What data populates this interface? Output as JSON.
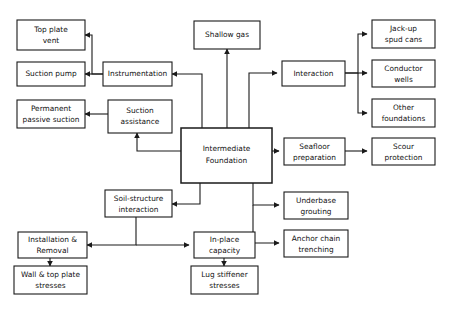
{
  "diagram": {
    "title": "Intermediate Foundation",
    "type": "flowchart",
    "colors": {
      "box_fill": "#ffffff",
      "box_stroke": "#1a1a1a",
      "text": "#111111",
      "background": "#ffffff"
    },
    "nodes": [
      {
        "id": "top_plate_vent",
        "label_line1": "Top plate",
        "label_line2": "vent"
      },
      {
        "id": "suction_pump",
        "label_line1": "Suction pump",
        "label_line2": ""
      },
      {
        "id": "permanent_passive",
        "label_line1": "Permanent",
        "label_line2": "passive suction"
      },
      {
        "id": "instrumentation",
        "label_line1": "Instrumentation",
        "label_line2": ""
      },
      {
        "id": "suction_assistance",
        "label_line1": "Suction",
        "label_line2": "assistance"
      },
      {
        "id": "shallow_gas",
        "label_line1": "Shallow gas",
        "label_line2": ""
      },
      {
        "id": "intermediate_foundation",
        "label_line1": "Intermediate",
        "label_line2": "Foundation"
      },
      {
        "id": "interaction",
        "label_line1": "Interaction",
        "label_line2": ""
      },
      {
        "id": "jackup_spud_cans",
        "label_line1": "Jack-up",
        "label_line2": "spud cans"
      },
      {
        "id": "conductor_wells",
        "label_line1": "Conductor",
        "label_line2": "wells"
      },
      {
        "id": "other_foundations",
        "label_line1": "Other",
        "label_line2": "foundations"
      },
      {
        "id": "seafloor_preparation",
        "label_line1": "Seafloor",
        "label_line2": "preparation"
      },
      {
        "id": "scour_protection",
        "label_line1": "Scour",
        "label_line2": "protection"
      },
      {
        "id": "underbase_grouting",
        "label_line1": "Underbase",
        "label_line2": "grouting"
      },
      {
        "id": "anchor_chain_trenching",
        "label_line1": "Anchor chain",
        "label_line2": "trenching"
      },
      {
        "id": "soil_structure",
        "label_line1": "Soil-structure",
        "label_line2": "interaction"
      },
      {
        "id": "installation_removal",
        "label_line1": "Installation &",
        "label_line2": "Removal"
      },
      {
        "id": "wall_top_plate",
        "label_line1": "Wall & top plate",
        "label_line2": "stresses"
      },
      {
        "id": "in_place_capacity",
        "label_line1": "In-place",
        "label_line2": "capacity"
      },
      {
        "id": "lug_stiffener",
        "label_line1": "Lug stiffener",
        "label_line2": "stresses"
      }
    ],
    "edges": [
      {
        "from": "intermediate_foundation",
        "to": "instrumentation"
      },
      {
        "from": "intermediate_foundation",
        "to": "shallow_gas"
      },
      {
        "from": "intermediate_foundation",
        "to": "interaction"
      },
      {
        "from": "intermediate_foundation",
        "to": "suction_assistance"
      },
      {
        "from": "intermediate_foundation",
        "to": "seafloor_preparation"
      },
      {
        "from": "intermediate_foundation",
        "to": "underbase_grouting"
      },
      {
        "from": "intermediate_foundation",
        "to": "anchor_chain_trenching"
      },
      {
        "from": "intermediate_foundation",
        "to": "soil_structure"
      },
      {
        "from": "instrumentation",
        "to": "top_plate_vent"
      },
      {
        "from": "instrumentation",
        "to": "suction_pump"
      },
      {
        "from": "suction_assistance",
        "to": "permanent_passive"
      },
      {
        "from": "interaction",
        "to": "jackup_spud_cans"
      },
      {
        "from": "interaction",
        "to": "conductor_wells"
      },
      {
        "from": "interaction",
        "to": "other_foundations"
      },
      {
        "from": "seafloor_preparation",
        "to": "scour_protection"
      },
      {
        "from": "soil_structure",
        "to": "installation_removal"
      },
      {
        "from": "soil_structure",
        "to": "in_place_capacity"
      },
      {
        "from": "installation_removal",
        "to": "wall_top_plate"
      },
      {
        "from": "in_place_capacity",
        "to": "lug_stiffener"
      }
    ]
  }
}
